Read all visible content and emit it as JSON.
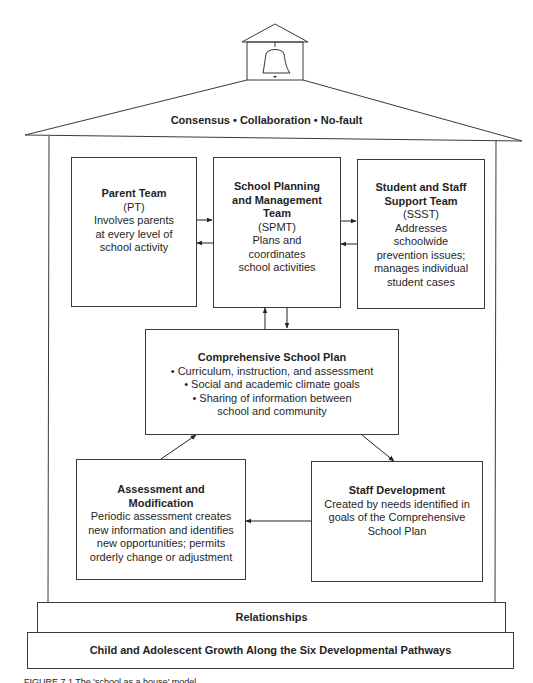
{
  "diagram": {
    "roof_label": "Consensus • Collaboration • No-fault",
    "bell_icon": "bell-icon",
    "boxes": {
      "parent_team": {
        "title": "Parent Team",
        "abbr": "(PT)",
        "lines": [
          "Involves parents",
          "at every level of",
          "school activity"
        ]
      },
      "spmt": {
        "title_lines": [
          "School Planning",
          "and Management",
          "Team"
        ],
        "abbr": "(SPMT)",
        "lines": [
          "Plans and",
          "coordinates",
          "school activities"
        ]
      },
      "ssst": {
        "title_lines": [
          "Student and Staff",
          "Support Team"
        ],
        "abbr": "(SSST)",
        "lines": [
          "Addresses",
          "schoolwide",
          "prevention issues;",
          "manages individual",
          "student cases"
        ]
      },
      "comprehensive_plan": {
        "title": "Comprehensive School Plan",
        "lines": [
          "• Curriculum, instruction, and assessment",
          "• Social and academic climate goals",
          "• Sharing of information between",
          "school and community"
        ]
      },
      "assessment": {
        "title_lines": [
          "Assessment and",
          "Modification"
        ],
        "lines": [
          "Periodic assessment creates",
          "new information and identifies",
          "new opportunities; permits",
          "orderly change or adjustment"
        ]
      },
      "staff_development": {
        "title": "Staff Development",
        "lines": [
          "Created by needs identified in",
          "goals of the Comprehensive",
          "School Plan"
        ]
      }
    },
    "foundation": {
      "relationships": "Relationships",
      "growth": "Child and Adolescent Growth Along the Six Developmental Pathways"
    },
    "caption_partial": "FIGURE 7.1    The 'school as a house' model"
  },
  "colors": {
    "stroke": "#3a3a3a",
    "text": "#1f1f1f",
    "background": "#ffffff"
  }
}
